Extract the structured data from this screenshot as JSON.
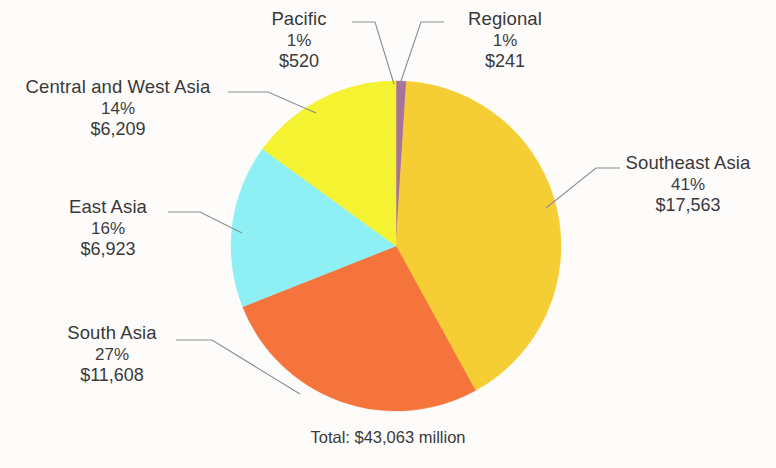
{
  "chart_data": {
    "type": "pie",
    "title": "",
    "subtitle": "",
    "total_label": "Total: $43,063 million",
    "total_value": 43063,
    "units": "million",
    "currency": "$",
    "legend": "callout-labels",
    "start_angle_deg": 0,
    "direction": "clockwise",
    "categories": [
      "Regional",
      "Southeast Asia",
      "South Asia",
      "East Asia",
      "Central and West Asia",
      "Pacific"
    ],
    "values": [
      241,
      17563,
      11608,
      6923,
      6209,
      520
    ],
    "percents": [
      1,
      41,
      27,
      16,
      14,
      1
    ],
    "colors": [
      "#A8739B",
      "#F5CE35",
      "#F4743B",
      "#8EF0F5",
      "#F5F232",
      "#F5F232"
    ],
    "slices": [
      {
        "name": "Regional",
        "percent": "1%",
        "value": "$241",
        "amount": 241,
        "pct": 1,
        "color": "#A8739B"
      },
      {
        "name": "Southeast Asia",
        "percent": "41%",
        "value": "$17,563",
        "amount": 17563,
        "pct": 41,
        "color": "#F5CE35"
      },
      {
        "name": "South Asia",
        "percent": "27%",
        "value": "$11,608",
        "amount": 11608,
        "pct": 27,
        "color": "#F4743B"
      },
      {
        "name": "East Asia",
        "percent": "16%",
        "value": "$6,923",
        "amount": 6923,
        "pct": 16,
        "color": "#8EF0F5"
      },
      {
        "name": "Central and West Asia",
        "percent": "14%",
        "value": "$6,209",
        "amount": 6209,
        "pct": 14,
        "color": "#F5F232"
      },
      {
        "name": "Pacific",
        "percent": "1%",
        "value": "$520",
        "amount": 520,
        "pct": 1,
        "color": "#F5F232"
      }
    ]
  },
  "labels": {
    "pacific": {
      "name": "Pacific",
      "percent": "1%",
      "value": "$520"
    },
    "regional": {
      "name": "Regional",
      "percent": "1%",
      "value": "$241"
    },
    "cwasia": {
      "name": "Central and West Asia",
      "percent": "14%",
      "value": "$6,209"
    },
    "eastasia": {
      "name": "East Asia",
      "percent": "16%",
      "value": "$6,923"
    },
    "southasia": {
      "name": "South Asia",
      "percent": "27%",
      "value": "$11,608"
    },
    "seasia": {
      "name": "Southeast Asia",
      "percent": "41%",
      "value": "$17,563"
    }
  },
  "footer": {
    "total": "Total: $43,063 million"
  },
  "style": {
    "background": "#fdfcfa",
    "leader_line_color": "#8d8d8d",
    "text_color": "#3a3a3a"
  }
}
